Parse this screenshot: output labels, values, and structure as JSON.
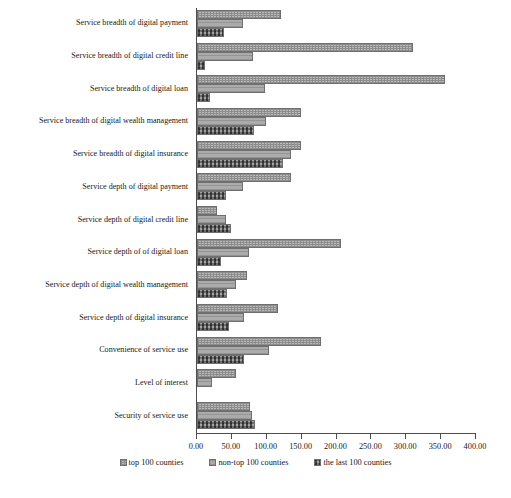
{
  "chart_data": {
    "type": "bar",
    "orientation": "horizontal",
    "title": "",
    "xlabel": "",
    "ylabel": "",
    "xlim": [
      0,
      400
    ],
    "xticks": [
      "0.00",
      "50.00",
      "100.00",
      "150.00",
      "200.00",
      "250.00",
      "300.00",
      "350.00",
      "400.00"
    ],
    "grid": false,
    "legend_position": "bottom-center",
    "categories": [
      "Service breadth of digital payment",
      "Service breadth of digital credit line",
      "Service breadth of digital loan",
      "Service breadth of digital wealth management",
      "Service breadth of digital insurance",
      "Service depth of digital payment",
      "Service depth of digital credit line",
      "Service depth of of digital loan",
      "Service depth of digital wealth management",
      "Service depth of digital insurance",
      "Convenience of service use",
      "Level of interest",
      "Security of service use"
    ],
    "series": [
      {
        "name": "top 100 counties",
        "values": [
          120,
          310,
          355,
          149,
          149,
          135,
          29,
          206,
          72,
          116,
          178,
          56,
          76
        ]
      },
      {
        "name": "non-top 100 counties",
        "values": [
          66,
          80,
          98,
          99,
          135,
          66,
          42,
          75,
          56,
          67,
          103,
          22,
          79
        ]
      },
      {
        "name": "the last 100 counties",
        "values": [
          39,
          11,
          18,
          82,
          123,
          42,
          49,
          34,
          43,
          46,
          67,
          0,
          83
        ]
      }
    ]
  },
  "colors": {
    "axis": "#4d4d4d",
    "bar_fill": "#b2b2b2",
    "bar_stroke": "#6f6f6f",
    "text": "#171717"
  }
}
